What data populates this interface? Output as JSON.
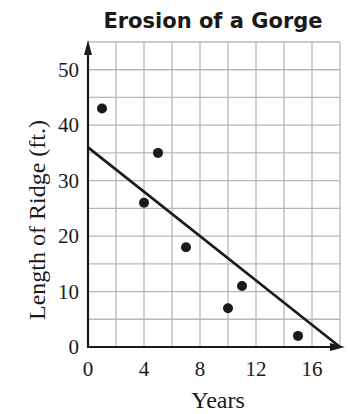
{
  "chart_data": {
    "type": "scatter",
    "title": "Erosion of a Gorge",
    "xlabel": "Years",
    "ylabel": "Length of Ridge (ft.)",
    "xlim": [
      0,
      18
    ],
    "ylim": [
      0,
      55
    ],
    "x_ticks": [
      0,
      4,
      8,
      12,
      16
    ],
    "y_ticks": [
      0,
      10,
      20,
      30,
      40,
      50
    ],
    "x_grid_step": 2,
    "y_grid_step": 5,
    "grid": true,
    "legend": null,
    "series": [
      {
        "name": "Observations",
        "type": "scatter",
        "points": [
          {
            "x": 1,
            "y": 43
          },
          {
            "x": 4,
            "y": 26
          },
          {
            "x": 5,
            "y": 35
          },
          {
            "x": 7,
            "y": 18
          },
          {
            "x": 10,
            "y": 7
          },
          {
            "x": 11,
            "y": 11
          },
          {
            "x": 15,
            "y": 2
          }
        ]
      },
      {
        "name": "Trend line",
        "type": "line",
        "points": [
          {
            "x": 0,
            "y": 36
          },
          {
            "x": 18,
            "y": 0
          }
        ]
      }
    ]
  },
  "colors": {
    "ink": "#1a1a1a",
    "grid": "#b8b8b8",
    "background": "#ffffff"
  }
}
